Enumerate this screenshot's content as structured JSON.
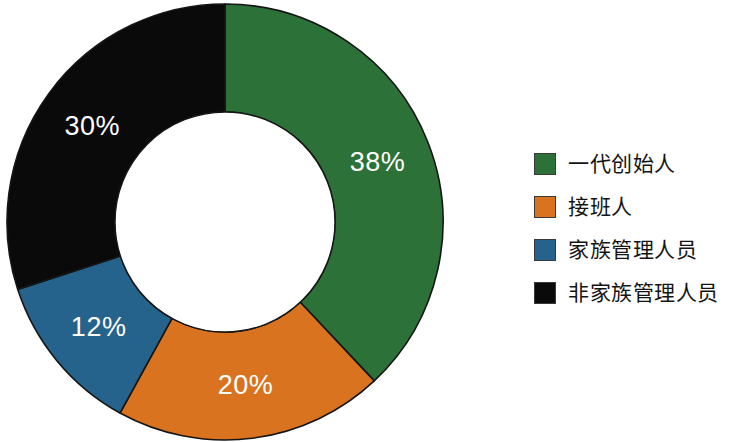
{
  "chart_data": {
    "type": "pie",
    "variant": "donut",
    "title": "",
    "subtitle": "",
    "xlabel": "",
    "ylabel": "",
    "grid": false,
    "legend_position": "right",
    "value_suffix": "%",
    "start_angle_deg": 0,
    "direction": "clockwise",
    "categories": [
      "一代创始人",
      "接班人",
      "家族管理人员",
      "非家族管理人员"
    ],
    "values": [
      38,
      20,
      12,
      30
    ],
    "labels": [
      "38%",
      "20%",
      "12%",
      "30%"
    ],
    "colors": [
      "#2c7238",
      "#d9731f",
      "#25628c",
      "#0a0a0a"
    ],
    "slices": [
      {
        "name": "一代创始人",
        "value": 38,
        "label": "38%",
        "color": "#2c7238",
        "label_color": "#ffffff"
      },
      {
        "name": "接班人",
        "value": 20,
        "label": "20%",
        "color": "#d9731f",
        "label_color": "#ffffff"
      },
      {
        "name": "家族管理人员",
        "value": 12,
        "label": "12%",
        "color": "#25628c",
        "label_color": "#ffffff"
      },
      {
        "name": "非家族管理人员",
        "value": 30,
        "label": "30%",
        "color": "#0a0a0a",
        "label_color": "#ffffff"
      }
    ],
    "total": 100
  },
  "geometry": {
    "center_x": 225,
    "center_y": 222,
    "outer_radius": 218,
    "inner_radius": 110,
    "label_radius": 164
  },
  "legend": {
    "items": [
      {
        "label": "一代创始人",
        "color": "#2c7238"
      },
      {
        "label": "接班人",
        "color": "#d9731f"
      },
      {
        "label": "家族管理人员",
        "color": "#25628c"
      },
      {
        "label": "非家族管理人员",
        "color": "#0a0a0a"
      }
    ]
  },
  "canvas": {
    "background": "#ffffff",
    "outline_color": "#151515"
  }
}
